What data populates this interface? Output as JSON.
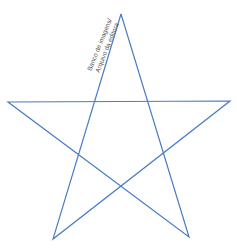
{
  "figure": {
    "shape": "five-pointed-star",
    "stroke_color": "#4a7cc4",
    "stroke_width": 1.2,
    "vertices": {
      "top": [
        121,
        14
      ],
      "left": [
        8,
        102
      ],
      "right": [
        230,
        101
      ],
      "bottom_left": [
        53,
        239
      ],
      "bottom_right": [
        189,
        237
      ]
    }
  },
  "credit": {
    "line1": "Banco de imagens/",
    "line2": "Arquivo da editora"
  }
}
